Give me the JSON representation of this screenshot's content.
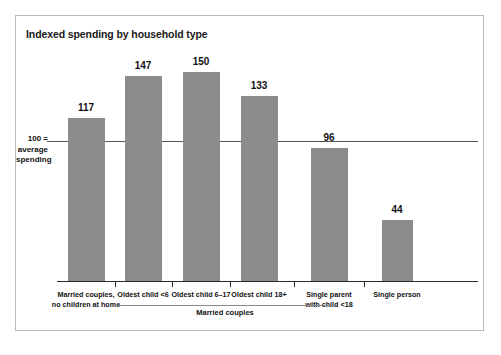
{
  "figure": {
    "title": "Indexed spending by household type",
    "y_axis_note_line1": "100 =",
    "y_axis_note_line2": "average",
    "y_axis_note_line3": "spending",
    "group_bracket_label": "Married couples",
    "bar_color": "#8c8c8c",
    "axis_color": "#2b2b2b",
    "reference_line_color": "#555555",
    "frame_color": "#b9b9b9",
    "background_color": "#ffffff"
  },
  "chart_data": {
    "type": "bar",
    "title": "Indexed spending by household type",
    "xlabel": "",
    "ylabel": "100 = average spending",
    "ylim": [
      0,
      160
    ],
    "grid": false,
    "legend": "none",
    "reference_line": 100,
    "reference_line_label": "100 = average spending",
    "categories": [
      "Married couples, no children at home",
      "Oldest child <6",
      "Oldest child 6–17",
      "Oldest child 18+",
      "Single parent with child <18",
      "Single person"
    ],
    "category_lines": [
      [
        "Married couples,",
        "no children at home"
      ],
      [
        "Oldest child <6"
      ],
      [
        "Oldest child 6–17"
      ],
      [
        "Oldest child 18+"
      ],
      [
        "Single parent",
        "with child <18"
      ],
      [
        "Single person"
      ]
    ],
    "values": [
      117,
      147,
      150,
      133,
      96,
      44
    ],
    "value_labels": [
      "117",
      "147",
      "150",
      "133",
      "96",
      "44"
    ],
    "annotations": [
      {
        "text": "Married couples",
        "covers_categories": [
          "Oldest child <6",
          "Oldest child 6–17",
          "Oldest child 18+"
        ]
      }
    ]
  }
}
